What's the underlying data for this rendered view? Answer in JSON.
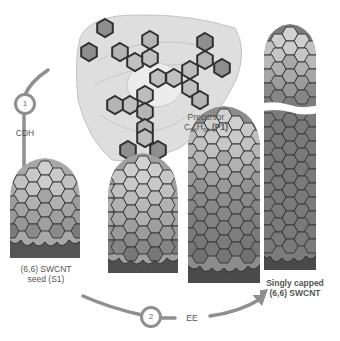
{
  "diagram": {
    "precursor": {
      "label_line1": "Precursor",
      "formula_C": "C",
      "formula_C_sub": "96",
      "formula_H": "H",
      "formula_H_sub": "54",
      "formula_id": "(P1)"
    },
    "step1": {
      "number": "1",
      "label": "CDH"
    },
    "step2": {
      "number": "2",
      "label": "EE"
    },
    "seed": {
      "line1": "(6,6) SWCNT",
      "line2": "seed (S1)"
    },
    "product": {
      "line1": "Singly capped",
      "line2": "(6,6) SWCNT"
    },
    "colors": {
      "arrow": "#8f8f8f",
      "hex_outline": "#333333",
      "cap_light": "#c8c8c8",
      "tube_mid": "#a0a0a0",
      "tube_dark": "#7a7a7a",
      "rim_dark": "#505050",
      "pad": "#dcdcdc"
    }
  }
}
